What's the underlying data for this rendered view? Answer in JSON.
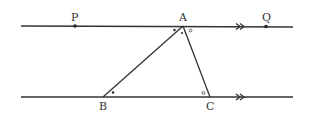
{
  "diagram": {
    "type": "geometry",
    "colors": {
      "stroke": "#333333",
      "background": "#ffffff"
    },
    "points": {
      "P": {
        "label": "P",
        "x": 75,
        "y": 26
      },
      "A": {
        "label": "A",
        "x": 183,
        "y": 26
      },
      "Q": {
        "label": "Q",
        "x": 266,
        "y": 26
      },
      "B": {
        "label": "B",
        "x": 103,
        "y": 97
      },
      "C": {
        "label": "C",
        "x": 210,
        "y": 97
      }
    },
    "lines": {
      "top": {
        "name": "PQ",
        "x1": 21,
        "x2": 293,
        "y": 26,
        "parallel_mark": "double-arrow",
        "mark_x": 240
      },
      "bottom": {
        "name": "BC",
        "x1": 21,
        "x2": 293,
        "y": 97,
        "parallel_mark": "double-arrow",
        "mark_x": 240
      }
    },
    "triangle": [
      "A",
      "B",
      "C"
    ],
    "angle_marks": [
      {
        "vertex": "A",
        "between": "PA-AB",
        "symbol": "dot"
      },
      {
        "vertex": "A",
        "between": "AB-AC",
        "symbol": "dot"
      },
      {
        "vertex": "A",
        "between": "AC-AQ",
        "symbol": "circle"
      },
      {
        "vertex": "B",
        "between": "BA-BC",
        "symbol": "dot"
      },
      {
        "vertex": "C",
        "between": "CA-CB",
        "symbol": "circle"
      }
    ]
  }
}
